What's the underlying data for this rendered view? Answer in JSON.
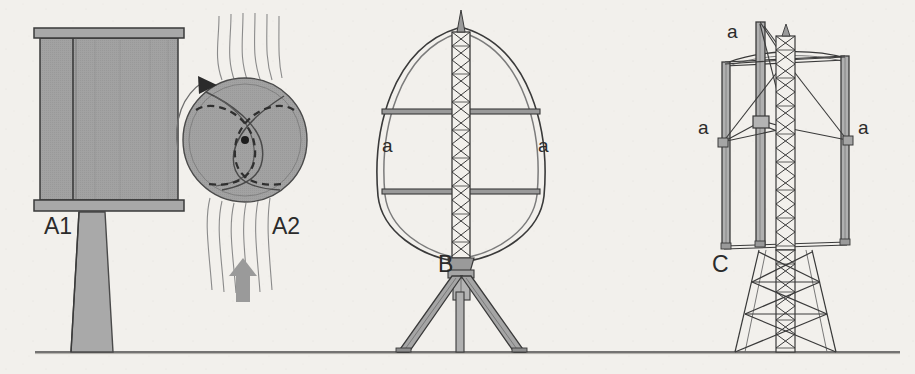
{
  "figure": {
    "background_color": "#f2f0ec",
    "ink_color": "#2b2b2b",
    "fill_gray": "#9a9a9a",
    "fill_gray_light": "#b4b4b4",
    "fill_gray_dark": "#888888",
    "ground_line": {
      "y": 352,
      "x_start": 35,
      "x_end": 900,
      "color": "#4a4a4a"
    }
  },
  "labels": {
    "a1": "A1",
    "a2": "A2",
    "b": "B",
    "c": "C",
    "blade_b_left": "a",
    "blade_b_right": "a",
    "blade_c_top": "a",
    "blade_c_left": "a",
    "blade_c_right": "a"
  },
  "panels": [
    {
      "id": "a1",
      "label": "A1",
      "name": "savonius-rotor-elevation",
      "description": "Savonius rotor side elevation on tapered pedestal",
      "label_x": 44,
      "label_y": 230,
      "rotor": {
        "x": 40,
        "y": 28,
        "width": 138,
        "height": 180,
        "cap_height": 10,
        "split_line_x": 72
      },
      "pedestal": {
        "top_width": 26,
        "bottom_width": 42,
        "top_y": 212,
        "bottom_y": 352,
        "center_x": 92
      }
    },
    {
      "id": "a2",
      "label": "A2",
      "name": "savonius-rotor-section",
      "description": "Savonius rotor plan cross-section with S-shaped blades and airflow streamlines",
      "label_x": 272,
      "label_y": 230,
      "circle": {
        "cx": 245,
        "cy": 140,
        "r": 62
      },
      "hub": {
        "cx": 245,
        "cy": 140,
        "r": 4
      },
      "rotation_arrow": {
        "direction": "clockwise"
      },
      "streamline_count": 6,
      "wind_arrow": {
        "x": 243,
        "y_tail": 300,
        "y_head": 262,
        "direction": "up",
        "color": "#9a9a9a"
      }
    },
    {
      "id": "b",
      "label": "B",
      "name": "darrieus-rotor",
      "description": "Darrieus eggbeater rotor with two curved blades on lattice mast and tripod base",
      "label_x": 443,
      "label_y": 268,
      "mast": {
        "x": 452,
        "top_y": 18,
        "bottom_y": 258,
        "width": 18,
        "lattice_bays": 16
      },
      "blades": [
        {
          "side": "left",
          "label": "a",
          "label_x": 384,
          "label_y": 147
        },
        {
          "side": "right",
          "label": "a",
          "label_x": 538,
          "label_y": 147
        }
      ],
      "struts": [
        {
          "y": 112
        },
        {
          "y": 192
        }
      ],
      "tripod": {
        "apex_x": 461,
        "apex_y": 270,
        "left_foot_x": 405,
        "right_foot_x": 517,
        "foot_y": 352
      }
    },
    {
      "id": "c",
      "label": "C",
      "name": "giromill-rotor",
      "description": "Giromill / H-rotor with straight vertical blades on lattice truss tower",
      "label_x": 717,
      "label_y": 268,
      "tower": {
        "x": 775,
        "top_y": 50,
        "bottom_y": 352,
        "lattice_bays": 22
      },
      "blades": [
        {
          "side": "top-left",
          "label": "a",
          "label_x": 727,
          "label_y": 32
        },
        {
          "side": "left",
          "label": "a",
          "label_x": 700,
          "label_y": 128
        },
        {
          "side": "right",
          "label": "a",
          "label_x": 841,
          "label_y": 128
        }
      ],
      "blade_span": {
        "top_y": 52,
        "bottom_y": 248
      },
      "truss_base": {
        "top_half_width": 26,
        "bottom_half_width": 62,
        "top_y": 248,
        "bottom_y": 352
      }
    }
  ]
}
